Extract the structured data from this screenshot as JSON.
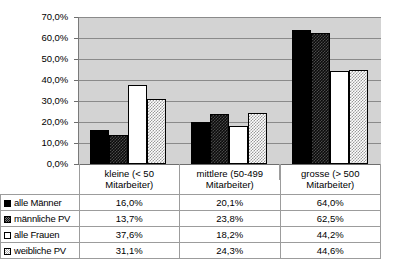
{
  "chart_data": {
    "type": "bar",
    "title": "",
    "xlabel": "",
    "ylabel": "",
    "ylim": [
      0,
      70
    ],
    "ytick_labels": [
      "0,0%",
      "10,0%",
      "20,0%",
      "30,0%",
      "40,0%",
      "50,0%",
      "60,0%",
      "70,0%"
    ],
    "ytick_values": [
      0,
      10,
      20,
      30,
      40,
      50,
      60,
      70
    ],
    "grid": true,
    "legend_position": "table-left-column",
    "plot_background": "#d3d3d3",
    "categories": [
      "kleine (< 50 Mitarbeiter)",
      "mittlere (50-499 Mitarbeiter)",
      "grosse (> 500 Mitarbeiter)"
    ],
    "category_lines": [
      [
        "kleine (< 50",
        "Mitarbeiter)"
      ],
      [
        "mittlere (50-499",
        "Mitarbeiter)"
      ],
      [
        "grosse (> 500",
        "Mitarbeiter)"
      ]
    ],
    "series": [
      {
        "name": "alle Männer",
        "pattern": "solid-black",
        "values": [
          16.0,
          20.1,
          64.0
        ],
        "labels": [
          "16,0%",
          "20,1%",
          "64,0%"
        ]
      },
      {
        "name": "männliche PV",
        "pattern": "dark-check",
        "values": [
          13.7,
          23.8,
          62.5
        ],
        "labels": [
          "13,7%",
          "23,8%",
          "62,5%"
        ]
      },
      {
        "name": "alle Frauen",
        "pattern": "white",
        "values": [
          37.6,
          18.2,
          44.2
        ],
        "labels": [
          "37,6%",
          "18,2%",
          "44,2%"
        ]
      },
      {
        "name": "weibliche PV",
        "pattern": "light-dot",
        "values": [
          31.1,
          24.3,
          44.6
        ],
        "labels": [
          "31,1%",
          "24,3%",
          "44,6%"
        ]
      }
    ]
  }
}
